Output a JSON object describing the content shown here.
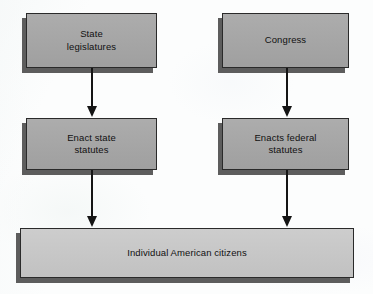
{
  "diagram": {
    "background_color": "#fcfdfd",
    "nodes": [
      {
        "id": "state-legislatures",
        "label": "State\nlegislatures",
        "fill": "#a8a8a8",
        "border": "#2a2a2a",
        "x": 26,
        "y": 13,
        "w": 131,
        "h": 55
      },
      {
        "id": "congress",
        "label": "Congress",
        "fill": "#a8a8a8",
        "border": "#2a2a2a",
        "x": 222,
        "y": 13,
        "w": 127,
        "h": 55
      },
      {
        "id": "enact-state-statutes",
        "label": "Enact state\nstatutes",
        "fill": "#a8a8a8",
        "border": "#2a2a2a",
        "x": 26,
        "y": 118,
        "w": 131,
        "h": 52
      },
      {
        "id": "enacts-federal-statutes",
        "label": "Enacts federal\nstatutes",
        "fill": "#a8a8a8",
        "border": "#2a2a2a",
        "x": 222,
        "y": 118,
        "w": 127,
        "h": 52
      },
      {
        "id": "individual-american-citizens",
        "label": "Individual American citizens",
        "fill": "#c9c9c9",
        "border": "#2a2a2a",
        "x": 20,
        "y": 228,
        "w": 334,
        "h": 50
      }
    ],
    "arrows": [
      {
        "id": "state-to-statutes",
        "from": "state-legislatures",
        "to": "enact-state-statutes",
        "x": 87,
        "y": 68,
        "w": 10,
        "h": 49
      },
      {
        "id": "congress-to-federal",
        "from": "congress",
        "to": "enacts-federal-statutes",
        "x": 282,
        "y": 68,
        "w": 10,
        "h": 49
      },
      {
        "id": "state-statutes-to-citizens",
        "from": "enact-state-statutes",
        "to": "individual-american-citizens",
        "x": 87,
        "y": 170,
        "w": 10,
        "h": 57
      },
      {
        "id": "federal-statutes-to-citizens",
        "from": "enacts-federal-statutes",
        "to": "individual-american-citizens",
        "x": 282,
        "y": 170,
        "w": 10,
        "h": 57
      }
    ]
  }
}
